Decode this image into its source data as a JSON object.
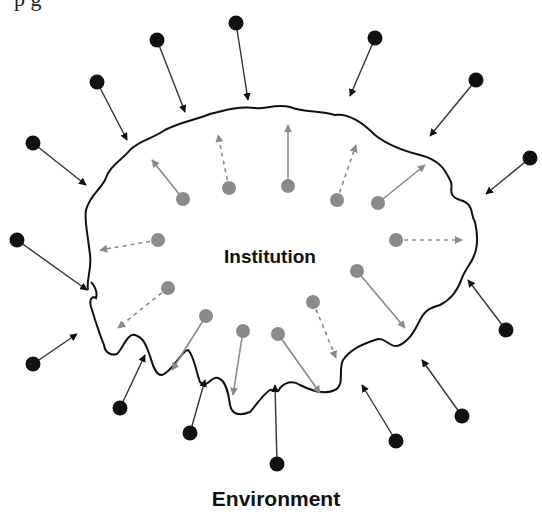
{
  "diagram": {
    "top_fragment": "p                  g",
    "center_label": "Institution",
    "bottom_label": "Environment",
    "colors": {
      "external_dot": "#111111",
      "internal_dot": "#8a8a8a",
      "boundary": "#111111",
      "external_arrow": "#111111",
      "internal_arrow": "#8a8a8a"
    },
    "external_forces_inward": [
      {
        "from": [
          157,
          40
        ],
        "to": [
          185,
          112
        ]
      },
      {
        "from": [
          236,
          23
        ],
        "to": [
          248,
          100
        ]
      },
      {
        "from": [
          375,
          38
        ],
        "to": [
          350,
          96
        ]
      },
      {
        "from": [
          476,
          80
        ],
        "to": [
          430,
          136
        ]
      },
      {
        "from": [
          530,
          158
        ],
        "to": [
          486,
          194
        ]
      },
      {
        "from": [
          97,
          82
        ],
        "to": [
          127,
          140
        ]
      },
      {
        "from": [
          33,
          143
        ],
        "to": [
          86,
          185
        ]
      },
      {
        "from": [
          17,
          240
        ],
        "to": [
          87,
          290
        ]
      },
      {
        "from": [
          33,
          364
        ],
        "to": [
          77,
          334
        ]
      },
      {
        "from": [
          120,
          408
        ],
        "to": [
          145,
          355
        ]
      },
      {
        "from": [
          190,
          433
        ],
        "to": [
          205,
          380
        ]
      },
      {
        "from": [
          277,
          464
        ],
        "to": [
          275,
          385
        ]
      },
      {
        "from": [
          396,
          441
        ],
        "to": [
          362,
          385
        ]
      },
      {
        "from": [
          462,
          416
        ],
        "to": [
          422,
          360
        ]
      },
      {
        "from": [
          506,
          330
        ],
        "to": [
          468,
          280
        ]
      }
    ],
    "internal_forces_outward": [
      {
        "from": [
          183,
          199
        ],
        "to": [
          152,
          160
        ],
        "style": "solid"
      },
      {
        "from": [
          229,
          188
        ],
        "to": [
          218,
          135
        ],
        "style": "dashed"
      },
      {
        "from": [
          288,
          186
        ],
        "to": [
          288,
          125
        ],
        "style": "solid"
      },
      {
        "from": [
          337,
          200
        ],
        "to": [
          356,
          145
        ],
        "style": "dashed"
      },
      {
        "from": [
          378,
          203
        ],
        "to": [
          425,
          165
        ],
        "style": "solid"
      },
      {
        "from": [
          396,
          240
        ],
        "to": [
          462,
          240
        ],
        "style": "dashed"
      },
      {
        "from": [
          158,
          240
        ],
        "to": [
          100,
          250
        ],
        "style": "dashed"
      },
      {
        "from": [
          168,
          288
        ],
        "to": [
          118,
          328
        ],
        "style": "dashed"
      },
      {
        "from": [
          206,
          316
        ],
        "to": [
          172,
          370
        ],
        "style": "solid"
      },
      {
        "from": [
          243,
          331
        ],
        "to": [
          233,
          395
        ],
        "style": "solid"
      },
      {
        "from": [
          278,
          334
        ],
        "to": [
          320,
          393
        ],
        "style": "solid"
      },
      {
        "from": [
          313,
          302
        ],
        "to": [
          336,
          358
        ],
        "style": "dashed"
      },
      {
        "from": [
          357,
          271
        ],
        "to": [
          405,
          328
        ],
        "style": "solid"
      }
    ]
  }
}
